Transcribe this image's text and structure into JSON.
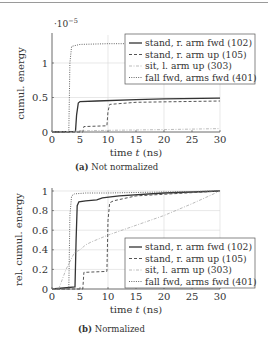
{
  "figure": {
    "captions": {
      "a_label": "(a)",
      "a_text": "Not normalized",
      "b_label": "(b)",
      "b_text": "Normalized"
    }
  },
  "colors": {
    "axis": "#444444",
    "grid": "#d8d8d8",
    "stand_fwd": "#333333",
    "stand_up": "#555555",
    "sit": "#aaaaaa",
    "fall": "#666666"
  },
  "chart_data": [
    {
      "id": "a",
      "type": "line",
      "title": "Not normalized",
      "xlabel": "time t (ns)",
      "ylabel": "cumul. energy",
      "y_multiplier": "·10^-5",
      "xlim": [
        0,
        30
      ],
      "ylim": [
        0,
        1.4
      ],
      "xticks": [
        0,
        5,
        10,
        15,
        20,
        25,
        30
      ],
      "yticks": [
        0,
        0.5,
        1
      ],
      "ytick_labels": [
        "0",
        "0.5",
        "1"
      ],
      "grid": {
        "x": [
          10,
          20,
          30
        ],
        "y": [
          0.5,
          1
        ]
      },
      "legend_position": "upper right",
      "series": [
        {
          "name": "stand, r. arm fwd (102)",
          "style": "solid",
          "x": [
            0,
            4.2,
            4.4,
            4.7,
            5,
            8,
            15,
            20,
            30
          ],
          "y": [
            0,
            0.01,
            0.25,
            0.42,
            0.44,
            0.45,
            0.47,
            0.48,
            0.49
          ]
        },
        {
          "name": "stand, r. arm up (105)",
          "style": "dashed",
          "x": [
            0,
            5.5,
            5.7,
            6,
            9.8,
            10,
            10.3,
            15,
            30
          ],
          "y": [
            0,
            0.0,
            0.08,
            0.08,
            0.09,
            0.3,
            0.4,
            0.43,
            0.45
          ]
        },
        {
          "name": "sit, l. arm up (303)",
          "style": "dashdot",
          "x": [
            0,
            2,
            5,
            10,
            20,
            30
          ],
          "y": [
            0,
            0.005,
            0.015,
            0.025,
            0.035,
            0.05
          ]
        },
        {
          "name": "fall fwd, arms fwd (401)",
          "style": "dotted",
          "x": [
            0,
            3.0,
            3.2,
            3.5,
            5,
            10,
            20,
            30
          ],
          "y": [
            0,
            0,
            1.0,
            1.24,
            1.27,
            1.28,
            1.28,
            1.28
          ]
        }
      ]
    },
    {
      "id": "b",
      "type": "line",
      "title": "Normalized",
      "xlabel": "time t (ns)",
      "ylabel": "rel. cumul. energy",
      "xlim": [
        0,
        30
      ],
      "ylim": [
        0,
        1
      ],
      "xticks": [
        0,
        5,
        10,
        15,
        20,
        25,
        30
      ],
      "yticks": [
        0,
        0.2,
        0.4,
        0.6,
        0.8,
        1
      ],
      "ytick_labels": [
        "0",
        "0.2",
        "0.4",
        "0.6",
        "0.8",
        "1"
      ],
      "grid": {
        "x": [
          10,
          20,
          30
        ],
        "y": [
          0.2,
          0.4,
          0.6,
          0.8,
          1
        ]
      },
      "legend_position": "lower right",
      "series": [
        {
          "name": "stand, r. arm fwd (102)",
          "style": "solid",
          "x": [
            0,
            4.1,
            4.3,
            4.5,
            4.8,
            6,
            8,
            9,
            12,
            20,
            30
          ],
          "y": [
            0,
            0.02,
            0.5,
            0.85,
            0.89,
            0.9,
            0.91,
            0.93,
            0.95,
            0.98,
            1.0
          ]
        },
        {
          "name": "stand, r. arm up (105)",
          "style": "dashed",
          "x": [
            0,
            5.5,
            5.7,
            6,
            9.8,
            10,
            10.3,
            11,
            15,
            30
          ],
          "y": [
            0,
            0.0,
            0.17,
            0.17,
            0.18,
            0.7,
            0.88,
            0.9,
            0.95,
            1.0
          ]
        },
        {
          "name": "sit, l. arm up (303)",
          "style": "dashdot",
          "x": [
            0,
            1.2,
            2.5,
            4,
            5,
            6,
            7,
            10,
            15,
            20,
            25,
            30
          ],
          "y": [
            0,
            0.0,
            0.2,
            0.37,
            0.4,
            0.45,
            0.48,
            0.55,
            0.65,
            0.75,
            0.87,
            1.0
          ]
        },
        {
          "name": "fall fwd, arms fwd (401)",
          "style": "dotted",
          "x": [
            0,
            3.0,
            3.2,
            3.5,
            4,
            6,
            10,
            20,
            30
          ],
          "y": [
            0,
            0,
            0.75,
            0.95,
            0.97,
            0.98,
            0.98,
            0.99,
            1.0
          ]
        }
      ]
    }
  ]
}
